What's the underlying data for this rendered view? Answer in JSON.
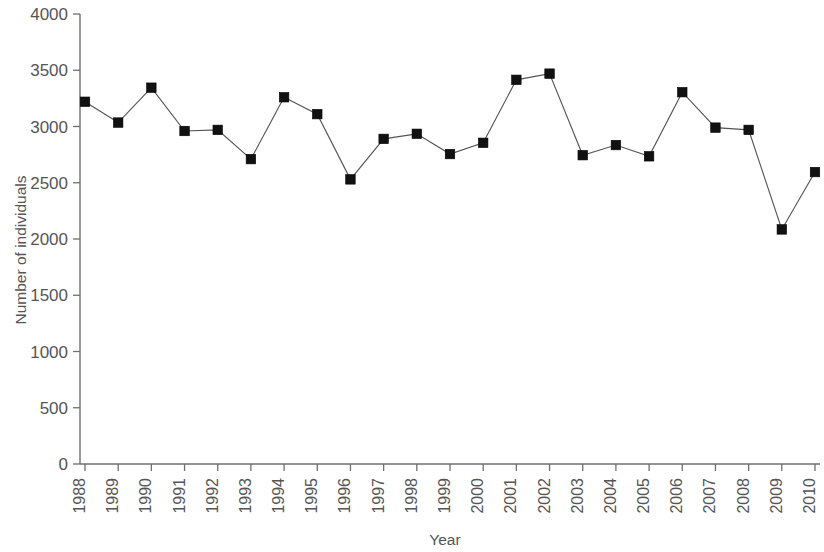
{
  "chart_data": {
    "type": "line",
    "title": "",
    "subtitle": "",
    "xlabel": "Year",
    "ylabel": "Number of individuals",
    "categories": [
      "1988",
      "1989",
      "1990",
      "1991",
      "1992",
      "1993",
      "1994",
      "1995",
      "1996",
      "1997",
      "1998",
      "1999",
      "2000",
      "2001",
      "2002",
      "2003",
      "2004",
      "2005",
      "2006",
      "2007",
      "2008",
      "2009",
      "2010"
    ],
    "values": [
      3220,
      3035,
      3345,
      2960,
      2970,
      2710,
      3260,
      3110,
      2530,
      2890,
      2935,
      2755,
      2855,
      3415,
      3470,
      2745,
      2835,
      2735,
      3305,
      2990,
      2970,
      2085,
      2595
    ],
    "series": [
      {
        "name": "Number of individuals",
        "values": [
          3220,
          3035,
          3345,
          2960,
          2970,
          2710,
          3260,
          3110,
          2530,
          2890,
          2935,
          2755,
          2855,
          3415,
          3470,
          2745,
          2835,
          2735,
          3305,
          2990,
          2970,
          2085,
          2595
        ]
      }
    ],
    "ylim": [
      0,
      4000
    ],
    "yticks": [
      0,
      500,
      1000,
      1500,
      2000,
      2500,
      3000,
      3500,
      4000
    ],
    "ytick_labels": [
      "0",
      "500",
      "1000",
      "1500",
      "2000",
      "2500",
      "3000",
      "3500",
      "4000"
    ],
    "xlim": [
      "1988",
      "2010"
    ],
    "grid": false,
    "legend": false,
    "legend_position": "none",
    "marker_style": "square",
    "line_color": "#555555",
    "marker_color": "#111111",
    "axis_color": "#6f6f6f",
    "background_color": "#ffffff",
    "xtick_rotation": 90
  }
}
